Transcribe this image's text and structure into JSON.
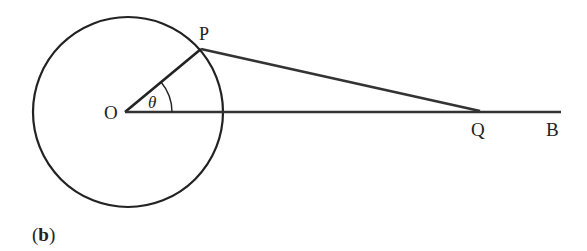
{
  "figure": {
    "caption": "(b)",
    "caption_open": "(",
    "caption_letter": "b",
    "caption_close": ")"
  },
  "labels": {
    "center": "O",
    "point_on_circle": "P",
    "point_q": "Q",
    "point_b": "B",
    "angle": "θ"
  },
  "geometry": {
    "circle": {
      "cx": 128,
      "cy": 112,
      "r": 95
    },
    "O": [
      125,
      112
    ],
    "P": [
      201,
      49
    ],
    "Q": [
      480,
      112
    ],
    "B_end": [
      561,
      112
    ],
    "angle_arc_radius": 47
  },
  "colors": {
    "stroke": "#222222",
    "background": "#ffffff"
  }
}
